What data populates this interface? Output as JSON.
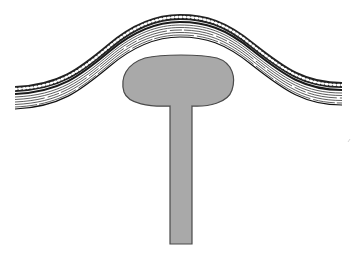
{
  "diagram": {
    "type": "geological-cross-section",
    "colors": {
      "background": "#ffffff",
      "diapir_fill": "#a9a9a9",
      "diapir_outline": "#4a4a4a",
      "strata_line": "#222222",
      "dot_fill": "#ffffff"
    },
    "strata": {
      "label": "folded sedimentary layers",
      "layers": [
        "dotted bed",
        "dark bed",
        "laminated beds"
      ]
    },
    "diapir": {
      "label": "diapir",
      "parts": [
        "cap",
        "stem"
      ]
    }
  }
}
